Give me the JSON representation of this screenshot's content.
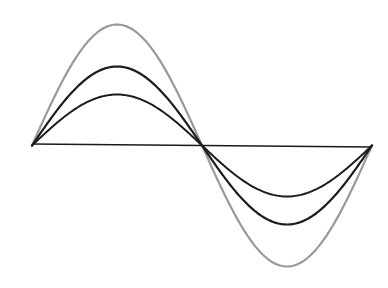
{
  "diagram": {
    "type": "sine-waves-amplitude-comparison",
    "axis": {
      "x1": 32,
      "x2": 372,
      "y1": 144,
      "y2": 147,
      "color": "#1a1a1a",
      "width": 1.6
    },
    "waves": [
      {
        "name": "large-amplitude-wave",
        "amplitude": 121,
        "color": "#999999",
        "width": 2.2
      },
      {
        "name": "medium-amplitude-wave",
        "amplitude": 79,
        "color": "#1c1c1c",
        "width": 2.2
      },
      {
        "name": "small-amplitude-wave",
        "amplitude": 51,
        "color": "#1c1c1c",
        "width": 2.0
      }
    ],
    "period_px": 340,
    "origin": {
      "x": 32,
      "y": 145.5
    }
  }
}
